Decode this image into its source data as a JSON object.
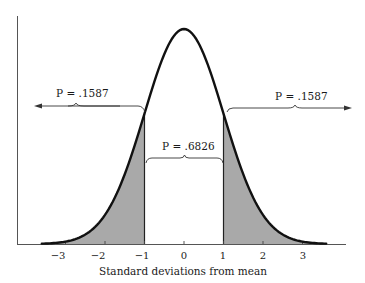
{
  "figure": {
    "title": "",
    "xlabel": "Standard deviations from mean",
    "tick_labels": [
      "−3",
      "−2",
      "−1",
      "0",
      "1",
      "2",
      "3"
    ],
    "annotations": {
      "left_tail": "P = .1587",
      "center": "P = .6826",
      "right_tail": "P = .1587"
    },
    "colors": {
      "curve": "#111111",
      "shade": "#a9a9a9",
      "axis": "#555555"
    }
  },
  "chart_data": {
    "type": "area",
    "title": "",
    "xlabel": "Standard deviations from mean",
    "ylabel": "",
    "x_ticks": [
      -3,
      -2,
      -1,
      0,
      1,
      2,
      3
    ],
    "xlim": [
      -3.6,
      3.6
    ],
    "distribution": "standard normal",
    "shaded_regions": [
      {
        "from": -3.6,
        "to": -1,
        "probability": 0.1587,
        "label": "P = .1587"
      },
      {
        "from": 1,
        "to": 3.6,
        "probability": 0.1587,
        "label": "P = .1587"
      }
    ],
    "unshaded_regions": [
      {
        "from": -1,
        "to": 1,
        "probability": 0.6826,
        "label": "P = .6826"
      }
    ],
    "grid": false,
    "legend": null
  }
}
